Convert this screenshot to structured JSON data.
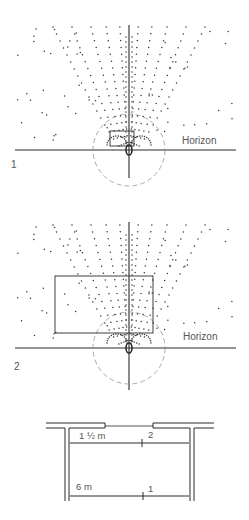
{
  "figure1": {
    "number": "1",
    "horizon_label": "Horizon",
    "eye_x": 129,
    "horizon_y": 150,
    "axis_top": 25,
    "axis_bottom": 178,
    "frame": {
      "x": 110,
      "y": 131,
      "w": 24,
      "h": 15
    },
    "circle_r": 36
  },
  "figure2": {
    "number": "2",
    "horizon_label": "Horizon",
    "eye_x": 129,
    "horizon_y": 348,
    "axis_top": 222,
    "axis_bottom": 390,
    "frame": {
      "x": 55,
      "y": 276,
      "w": 98,
      "h": 57
    },
    "circle_r": 36
  },
  "plan": {
    "distance_near_label": "1 ½ m",
    "distance_near_marker": "2",
    "distance_far_label": "6 m",
    "distance_far_marker": "1"
  },
  "colors": {
    "ink": "#2a2a2a",
    "dots": "#333333",
    "dashed": "#888888",
    "label": "#555555"
  }
}
